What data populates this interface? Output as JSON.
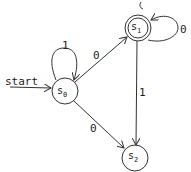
{
  "diagram": {
    "type": "finite-state-automaton",
    "start_label": "start",
    "states": [
      {
        "id": "s0",
        "name": "s",
        "sub": "0",
        "accepting": false,
        "start": true
      },
      {
        "id": "s1",
        "name": "s",
        "sub": "1",
        "accepting": true,
        "start": false
      },
      {
        "id": "s2",
        "name": "s",
        "sub": "2",
        "accepting": false,
        "start": false
      }
    ],
    "transitions": [
      {
        "from": "s0",
        "to": "s0",
        "label": "1"
      },
      {
        "from": "s0",
        "to": "s1",
        "label": "0"
      },
      {
        "from": "s0",
        "to": "s2",
        "label": "0"
      },
      {
        "from": "s1",
        "to": "s1",
        "label": "0"
      },
      {
        "from": "s1",
        "to": "s2",
        "label": "1"
      }
    ],
    "stroke_color": "#333333"
  }
}
